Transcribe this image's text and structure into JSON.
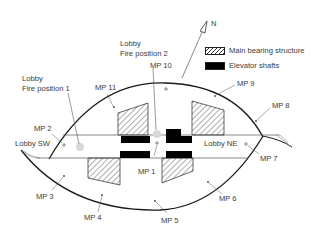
{
  "figure": {
    "north_label": "N",
    "legend": [
      {
        "label": "Main bearing structure",
        "pattern": "hatched",
        "color": "#222222"
      },
      {
        "label": "Elevator shafts",
        "pattern": "solid",
        "color": "#000000"
      }
    ],
    "lobbies": {
      "sw": "Lobby SW",
      "ne": "Lobby NE",
      "fire1": [
        "Lobby",
        "Fire position 1"
      ],
      "fire2": [
        "Lobby",
        "Fire position 2"
      ]
    },
    "measurement_points": [
      {
        "id": "MP 1",
        "x": 157,
        "y": 143
      },
      {
        "id": "MP 2",
        "x": 63,
        "y": 144
      },
      {
        "id": "MP 3",
        "x": 64,
        "y": 177
      },
      {
        "id": "MP 4",
        "x": 101,
        "y": 196
      },
      {
        "id": "MP 5",
        "x": 155,
        "y": 202
      },
      {
        "id": "MP 6",
        "x": 208,
        "y": 182
      },
      {
        "id": "MP 7",
        "x": 246,
        "y": 144
      },
      {
        "id": "MP 8",
        "x": 256,
        "y": 121
      },
      {
        "id": "MP 9",
        "x": 215,
        "y": 96
      },
      {
        "id": "MP 10",
        "x": 166,
        "y": 89
      },
      {
        "id": "MP 11",
        "x": 114,
        "y": 107
      }
    ],
    "fire_positions": [
      {
        "name": "Fire position 1",
        "x": 80,
        "y": 147
      },
      {
        "name": "Fire position 2",
        "x": 157,
        "y": 134
      }
    ],
    "colors": {
      "line": "#1a1a1a",
      "thin_line": "#555555",
      "fire_marker": "#d8d8d8",
      "text": "#3a3a3a"
    }
  }
}
